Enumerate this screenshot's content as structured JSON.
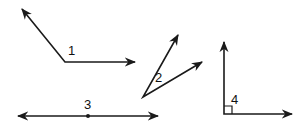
{
  "colors": {
    "stroke": "#1a1a1a",
    "background": "#ffffff"
  },
  "figures": [
    {
      "id": "angle-1",
      "label": "1",
      "type": "obtuse-angle",
      "vertex": [
        65,
        62
      ],
      "rays": [
        [
          22,
          9
        ],
        [
          135,
          62
        ]
      ],
      "label_pos": [
        68,
        55
      ]
    },
    {
      "id": "angle-2",
      "label": "2",
      "type": "acute-angle",
      "vertex": [
        143,
        97
      ],
      "rays": [
        [
          178,
          35
        ],
        [
          202,
          62
        ]
      ],
      "label_pos": [
        155,
        82
      ]
    },
    {
      "id": "line-3",
      "label": "3",
      "type": "straight-angle",
      "vertex": [
        88,
        116
      ],
      "rays": [
        [
          18,
          116
        ],
        [
          158,
          116
        ]
      ],
      "label_pos": [
        84,
        109
      ]
    },
    {
      "id": "angle-4",
      "label": "4",
      "type": "right-angle",
      "vertex": [
        224,
        114
      ],
      "rays": [
        [
          224,
          42
        ],
        [
          292,
          114
        ]
      ],
      "label_pos": [
        230,
        108
      ]
    }
  ]
}
